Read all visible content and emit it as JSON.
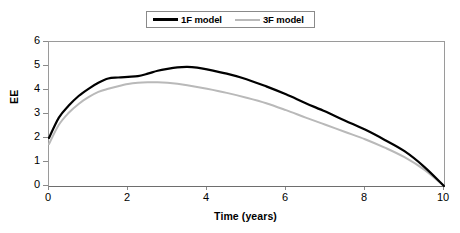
{
  "chart_data": {
    "type": "line",
    "title": "",
    "xlabel": "Time (years)",
    "ylabel": "EE",
    "xlim": [
      0,
      10
    ],
    "ylim": [
      0,
      6
    ],
    "xticks": [
      0,
      2,
      4,
      6,
      8,
      10
    ],
    "yticks": [
      0,
      1,
      2,
      3,
      4,
      5,
      6
    ],
    "xtick_labels": [
      "0",
      "2",
      "4",
      "6",
      "8",
      "10"
    ],
    "ytick_labels": [
      "0",
      "1",
      "2",
      "3",
      "4",
      "5",
      "6"
    ],
    "grid": false,
    "legend_position": "top-center",
    "series": [
      {
        "name": "1F model",
        "color": "#000000",
        "line_width": 2.2,
        "x": [
          0,
          0.25,
          0.5,
          0.75,
          1.0,
          1.25,
          1.5,
          1.75,
          2.0,
          2.25,
          2.5,
          2.75,
          3.0,
          3.25,
          3.5,
          3.75,
          4.0,
          4.5,
          5.0,
          5.5,
          6.0,
          6.5,
          7.0,
          7.5,
          8.0,
          8.5,
          9.0,
          9.5,
          10.0
        ],
        "y": [
          2.0,
          2.85,
          3.35,
          3.75,
          4.05,
          4.3,
          4.48,
          4.52,
          4.55,
          4.58,
          4.68,
          4.8,
          4.88,
          4.94,
          4.96,
          4.93,
          4.86,
          4.68,
          4.45,
          4.15,
          3.82,
          3.45,
          3.1,
          2.72,
          2.35,
          1.92,
          1.45,
          0.8,
          0.0
        ]
      },
      {
        "name": "3F model",
        "color": "#b9b9b9",
        "line_width": 2.0,
        "x": [
          0,
          0.25,
          0.5,
          0.75,
          1.0,
          1.25,
          1.5,
          1.75,
          2.0,
          2.25,
          2.5,
          2.75,
          3.0,
          3.25,
          3.5,
          4.0,
          4.5,
          5.0,
          5.5,
          6.0,
          6.5,
          7.0,
          7.5,
          8.0,
          8.5,
          9.0,
          9.5,
          10.0
        ],
        "y": [
          1.75,
          2.55,
          3.05,
          3.42,
          3.7,
          3.92,
          4.05,
          4.16,
          4.25,
          4.3,
          4.32,
          4.32,
          4.3,
          4.26,
          4.2,
          4.05,
          3.88,
          3.68,
          3.45,
          3.16,
          2.85,
          2.55,
          2.25,
          1.95,
          1.6,
          1.2,
          0.68,
          0.0
        ]
      }
    ]
  },
  "legend": {
    "entries": [
      {
        "label": "1F model",
        "marker": "thick-black-line"
      },
      {
        "label": "3F model",
        "marker": "thin-gray-line"
      }
    ]
  },
  "axes": {
    "y_title": "EE",
    "x_title": "Time (years)"
  },
  "caption": {
    "text": "",
    "note": "partially cropped caption line at bottom edge"
  },
  "colors": {
    "series_1f": "#000000",
    "series_3f": "#b9b9b9",
    "frame": "#9a9a9a",
    "background": "#ffffff"
  }
}
